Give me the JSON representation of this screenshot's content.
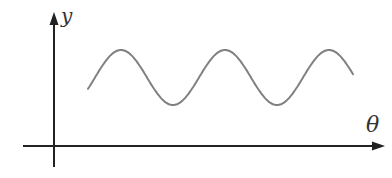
{
  "chart_data": {
    "type": "line",
    "title": "",
    "xlabel": "θ",
    "ylabel": "y",
    "grid": false,
    "legend": null,
    "series": [
      {
        "name": "y(θ)",
        "shape": "sine",
        "points_px": [
          [
            88,
            88
          ],
          [
            121,
            50
          ],
          [
            173,
            105
          ],
          [
            226,
            50
          ],
          [
            278,
            105
          ],
          [
            329,
            50
          ],
          [
            353,
            72
          ]
        ]
      }
    ]
  },
  "labels": {
    "y_axis": "y",
    "x_axis": "θ"
  },
  "colors": {
    "axis": "#222222",
    "curve": "#808080",
    "label": "#333333"
  }
}
